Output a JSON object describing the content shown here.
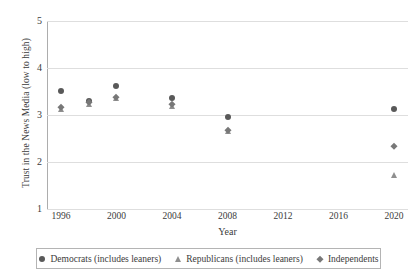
{
  "chart_data": {
    "type": "scatter",
    "title": "",
    "xlabel": "Year",
    "ylabel": "Trust in the News Media (low to high)",
    "xlim": [
      1995,
      2021
    ],
    "ylim": [
      1,
      5
    ],
    "xticks": [
      "1996",
      "2000",
      "2004",
      "2008",
      "2012",
      "2016",
      "2020"
    ],
    "yticks": [
      "1",
      "2",
      "3",
      "4",
      "5"
    ],
    "grid": true,
    "legend_position": "bottom",
    "x": [
      1996,
      1998,
      2000,
      2004,
      2008,
      2020
    ],
    "series": [
      {
        "name": "Democrats (includes leaners)",
        "marker": "circle",
        "color": "#595959",
        "x": [
          1996,
          1998,
          2000,
          2004,
          2008,
          2020
        ],
        "values": [
          3.51,
          3.3,
          3.62,
          3.37,
          2.95,
          3.12
        ]
      },
      {
        "name": "Republicans (includes leaners)",
        "marker": "triangle",
        "color": "#8f8f8f",
        "x": [
          1996,
          1998,
          2000,
          2004,
          2008,
          2020
        ],
        "values": [
          3.12,
          3.24,
          3.36,
          3.2,
          2.66,
          1.72
        ]
      },
      {
        "name": "Independents",
        "marker": "diamond",
        "color": "#787878",
        "x": [
          1996,
          1998,
          2000,
          2004,
          2008,
          2020
        ],
        "values": [
          3.17,
          3.27,
          3.38,
          3.24,
          2.69,
          2.33
        ]
      }
    ]
  },
  "axes": {
    "ylabel": "Trust in the News Media (low to high)",
    "xlabel": "Year",
    "yticks": [
      {
        "label": "5",
        "value": 5
      },
      {
        "label": "4",
        "value": 4
      },
      {
        "label": "3",
        "value": 3
      },
      {
        "label": "2",
        "value": 2
      },
      {
        "label": "1",
        "value": 1
      }
    ],
    "xticks": [
      {
        "label": "1996",
        "value": 1996
      },
      {
        "label": "2000",
        "value": 2000
      },
      {
        "label": "2004",
        "value": 2004
      },
      {
        "label": "2008",
        "value": 2008
      },
      {
        "label": "2012",
        "value": 2012
      },
      {
        "label": "2016",
        "value": 2016
      },
      {
        "label": "2020",
        "value": 2020
      }
    ]
  },
  "legend": {
    "entries": [
      {
        "label": "Democrats (includes leaners)",
        "marker": "circle-marker-icon"
      },
      {
        "label": "Republicans (includes leaners)",
        "marker": "triangle-marker-icon"
      },
      {
        "label": "Independents",
        "marker": "diamond-marker-icon"
      }
    ]
  }
}
